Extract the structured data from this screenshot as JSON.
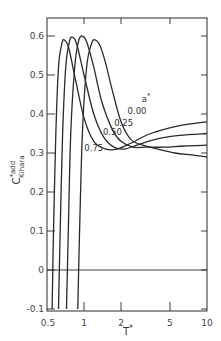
{
  "chart_data": {
    "type": "line",
    "title": "",
    "xlabel": "T*",
    "ylabel": "C*add Kihara",
    "ylabel_main": "C",
    "ylabel_sup": "*add",
    "ylabel_sub": "Kihara",
    "xscale": "log",
    "xlim": [
      0.5,
      10
    ],
    "ylim": [
      -0.1,
      0.65
    ],
    "grid": false,
    "legend_title": "a*",
    "x_ticks": [
      {
        "value": 0.5,
        "label": "0.5"
      },
      {
        "value": 1,
        "label": "1"
      },
      {
        "value": 2,
        "label": "2"
      },
      {
        "value": 5,
        "label": "5"
      },
      {
        "value": 10,
        "label": "10"
      }
    ],
    "y_ticks": [
      {
        "value": -0.1,
        "label": "-0.1"
      },
      {
        "value": 0,
        "label": "0"
      },
      {
        "value": 0.1,
        "label": "0.1"
      },
      {
        "value": 0.2,
        "label": "0.2"
      },
      {
        "value": 0.3,
        "label": "0.3"
      },
      {
        "value": 0.4,
        "label": "0.4"
      },
      {
        "value": 0.5,
        "label": "0.5"
      },
      {
        "value": 0.6,
        "label": "0.6"
      }
    ],
    "zero_line": true,
    "series": [
      {
        "name": "0.00",
        "x": [
          0.89,
          0.92,
          0.97,
          1.05,
          1.15,
          1.23,
          1.35,
          1.5,
          1.7,
          2.0,
          2.4,
          3.0,
          4.0,
          5.5,
          7.5,
          10.0
        ],
        "y": [
          -0.1,
          0.1,
          0.35,
          0.52,
          0.58,
          0.59,
          0.575,
          0.53,
          0.46,
          0.38,
          0.335,
          0.32,
          0.31,
          0.3,
          0.295,
          0.29
        ]
      },
      {
        "name": "0.25",
        "x": [
          0.72,
          0.745,
          0.78,
          0.84,
          0.9,
          0.96,
          1.05,
          1.2,
          1.4,
          1.7,
          2.0,
          2.5,
          3.2,
          4.5,
          6.5,
          10.0
        ],
        "y": [
          -0.1,
          0.1,
          0.35,
          0.52,
          0.585,
          0.6,
          0.585,
          0.52,
          0.43,
          0.36,
          0.33,
          0.315,
          0.315,
          0.315,
          0.318,
          0.32
        ]
      },
      {
        "name": "0.50",
        "x": [
          0.62,
          0.64,
          0.67,
          0.71,
          0.76,
          0.8,
          0.87,
          1.0,
          1.2,
          1.45,
          1.75,
          2.1,
          2.7,
          3.8,
          6.0,
          10.0
        ],
        "y": [
          -0.1,
          0.1,
          0.35,
          0.52,
          0.585,
          0.597,
          0.58,
          0.5,
          0.4,
          0.34,
          0.315,
          0.31,
          0.32,
          0.335,
          0.345,
          0.35
        ]
      },
      {
        "name": "0.75",
        "x": [
          0.55,
          0.565,
          0.59,
          0.62,
          0.66,
          0.69,
          0.75,
          0.85,
          1.0,
          1.2,
          1.5,
          1.85,
          2.4,
          3.5,
          6.0,
          10.0
        ],
        "y": [
          -0.1,
          0.1,
          0.35,
          0.52,
          0.58,
          0.59,
          0.57,
          0.49,
          0.39,
          0.33,
          0.31,
          0.31,
          0.325,
          0.35,
          0.37,
          0.38
        ]
      }
    ],
    "annotations": [
      {
        "text": "a*",
        "x": 3.2,
        "y": 0.43
      },
      {
        "text": "0.00",
        "x": 2.7,
        "y": 0.4
      },
      {
        "text": "0.25",
        "x": 2.1,
        "y": 0.37
      },
      {
        "text": "0.50",
        "x": 1.7,
        "y": 0.345
      },
      {
        "text": "0.75",
        "x": 1.2,
        "y": 0.305
      }
    ]
  }
}
